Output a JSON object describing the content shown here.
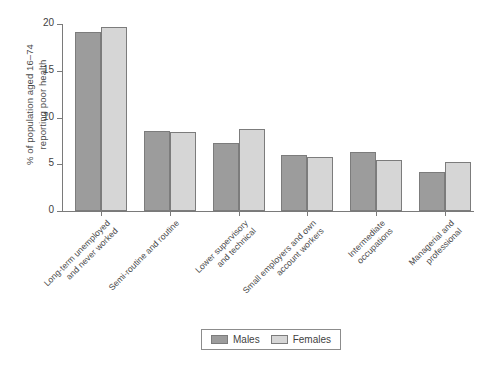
{
  "chart_data": {
    "type": "bar",
    "title": "",
    "subtitle": "",
    "xlabel": "",
    "ylabel": "% of population aged 16–74\nreporting poor health",
    "ylim": [
      0,
      20
    ],
    "yticks": [
      0,
      5,
      10,
      15,
      20
    ],
    "ytick_labels": [
      "0",
      "5",
      "10",
      "15",
      "20"
    ],
    "grid": false,
    "legend_position": "bottom-center",
    "categories": [
      "Long-term unemployed\nand never worked",
      "Semi-routine and routine",
      "Lower supervisory\nand technical",
      "Small employers and own\naccount workers",
      "Intermediate\noccupations",
      "Managerial and\nprofessional"
    ],
    "series": [
      {
        "name": "Males",
        "color": "#9c9c9c",
        "values": [
          19.1,
          8.6,
          7.3,
          6.0,
          6.3,
          4.2
        ]
      },
      {
        "name": "Females",
        "color": "#d6d6d6",
        "values": [
          19.7,
          8.4,
          8.8,
          5.8,
          5.5,
          5.2
        ]
      }
    ]
  },
  "legend": {
    "items": [
      {
        "label": "Males",
        "swatch": "males"
      },
      {
        "label": "Females",
        "swatch": "females"
      }
    ]
  },
  "colors": {
    "males": "#9c9c9c",
    "females": "#d6d6d6",
    "axis": "#7a7a7a",
    "text": "#4a4a4a",
    "background": "#ffffff"
  }
}
